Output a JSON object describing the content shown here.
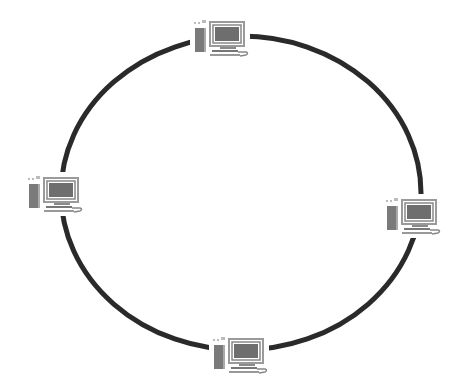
{
  "diagram": {
    "type": "ring-network-topology",
    "ring": {
      "cx": 241,
      "cy": 193,
      "rx": 180,
      "ry": 157,
      "stroke": "#2a2a2a",
      "stroke_width": 5
    },
    "nodes": [
      {
        "id": "top",
        "icon": "desktop-computer-icon",
        "x": 190,
        "y": 16
      },
      {
        "id": "left",
        "icon": "desktop-computer-icon",
        "x": 24,
        "y": 172
      },
      {
        "id": "right",
        "icon": "desktop-computer-icon",
        "x": 382,
        "y": 194
      },
      {
        "id": "bottom",
        "icon": "desktop-computer-icon",
        "x": 209,
        "y": 333
      }
    ],
    "colors": {
      "background": "#ffffff",
      "ring": "#2a2a2a",
      "screen": "#6e6e6e",
      "tower": "#7a7a7a",
      "frame": "#9a9a9a"
    }
  }
}
